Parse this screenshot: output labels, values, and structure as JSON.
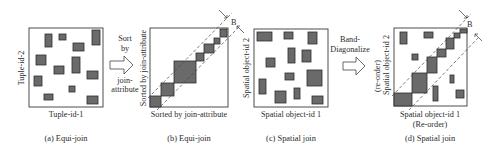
{
  "figure": {
    "panels": [
      {
        "id": "a",
        "caption": "(a) Equi-join",
        "x_label": "Tuple-id-1",
        "y_label": "Tuple-id-2",
        "frame": [
          29,
          28,
          74,
          79
        ],
        "blocks": [
          [
            45,
            34,
            7,
            13
          ],
          [
            59,
            34,
            7,
            6
          ],
          [
            92,
            30,
            8,
            15
          ],
          [
            73,
            43,
            11,
            8
          ],
          [
            36,
            55,
            10,
            10
          ],
          [
            72,
            57,
            8,
            16
          ],
          [
            54,
            66,
            10,
            8
          ],
          [
            87,
            71,
            11,
            8
          ],
          [
            34,
            76,
            8,
            10
          ],
          [
            69,
            86,
            6,
            6
          ],
          [
            44,
            94,
            9,
            6
          ],
          [
            87,
            96,
            11,
            8
          ]
        ]
      },
      {
        "id": "b",
        "caption": "(b) Equi-join",
        "x_label": "Sorted by join-attribute",
        "y_label": "Sorted by join-attribute",
        "frame": [
          150,
          28,
          78,
          79
        ],
        "band_label": "B",
        "blocks": [
          [
            150,
            96,
            11,
            11
          ],
          [
            161,
            83,
            13,
            13
          ],
          [
            174,
            61,
            22,
            22
          ],
          [
            196,
            53,
            8,
            8
          ],
          [
            204,
            44,
            10,
            9
          ],
          [
            214,
            38,
            6,
            6
          ],
          [
            220,
            29,
            7,
            8
          ]
        ]
      },
      {
        "id": "c",
        "caption": "(c) Spatial join",
        "x_label": "Spatial object-id 1",
        "y_label": "Spatial object-id 2",
        "frame": [
          254,
          29,
          74,
          78
        ],
        "blocks": [
          [
            257,
            32,
            15,
            9
          ],
          [
            284,
            32,
            9,
            7
          ],
          [
            308,
            32,
            9,
            12
          ],
          [
            302,
            50,
            9,
            12
          ],
          [
            288,
            48,
            7,
            15
          ],
          [
            266,
            58,
            9,
            9
          ],
          [
            285,
            73,
            9,
            7
          ],
          [
            307,
            70,
            15,
            16
          ],
          [
            259,
            79,
            7,
            15
          ],
          [
            275,
            91,
            11,
            12
          ],
          [
            294,
            88,
            6,
            11
          ],
          [
            312,
            96,
            11,
            8
          ]
        ]
      },
      {
        "id": "d",
        "caption": "(d) Spatial join",
        "x_label": "Spatial object-id 1",
        "x_label_2": "(Re-order)",
        "y_label": "Spatial object-id 2",
        "y_label_2": "(re-order)",
        "frame": [
          394,
          28,
          73,
          78
        ],
        "band_label": "B",
        "blocks": [
          [
            394,
            93,
            18,
            13
          ],
          [
            412,
            73,
            15,
            20
          ],
          [
            427,
            57,
            10,
            16
          ],
          [
            437,
            49,
            9,
            8
          ],
          [
            446,
            38,
            8,
            11
          ],
          [
            454,
            33,
            6,
            5
          ],
          [
            460,
            29,
            7,
            4
          ],
          [
            400,
            32,
            7,
            12
          ],
          [
            424,
            32,
            9,
            6
          ],
          [
            412,
            54,
            6,
            6
          ],
          [
            450,
            75,
            4,
            8
          ],
          [
            433,
            86,
            5,
            15
          ],
          [
            456,
            90,
            8,
            8
          ]
        ]
      }
    ],
    "transitions": [
      {
        "id": "sort",
        "lines": [
          "Sort",
          "by",
          "",
          "join-",
          "attribute"
        ],
        "x": 113,
        "y": 55
      },
      {
        "id": "band-diag",
        "lines": [
          "Band-",
          "Diagonalize"
        ],
        "x": 350,
        "y": 47
      }
    ]
  }
}
